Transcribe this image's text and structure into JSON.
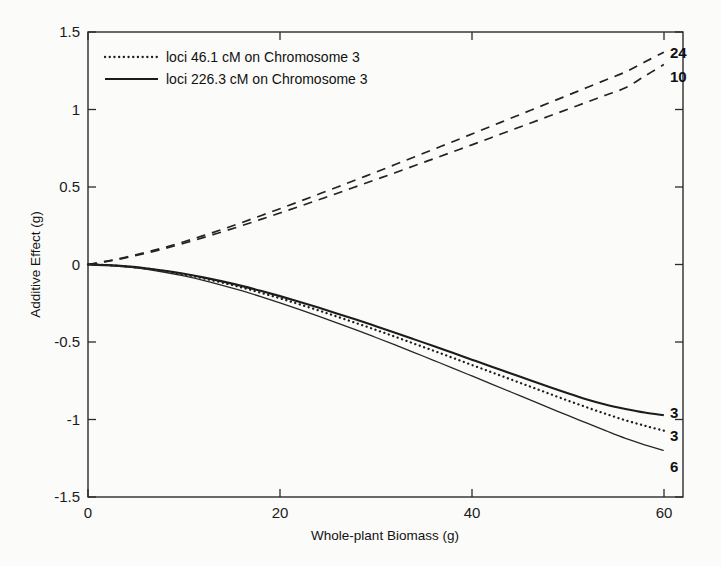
{
  "chart_data": {
    "type": "line",
    "title": "",
    "xlabel": "Whole-plant Biomass (g)",
    "ylabel": "Additive Effect (g)",
    "xlim": [
      0,
      62
    ],
    "ylim": [
      -1.5,
      1.5
    ],
    "xticks": [
      0,
      20,
      40,
      60
    ],
    "xtick_labels": [
      "0",
      "20",
      "40",
      "60"
    ],
    "yticks": [
      -1.5,
      -1,
      -0.5,
      0,
      0.5,
      1,
      1.5
    ],
    "ytick_labels": [
      "-1.5",
      "-1",
      "-0.5",
      "0",
      "0.5",
      "1",
      "1.5"
    ],
    "grid": false,
    "legend_position": "upper-left",
    "legend": [
      {
        "label": "loci 46.1 cM on Chromosome 3",
        "style": "dotted"
      },
      {
        "label": "loci 226.3 cM on Chromosome 3",
        "style": "solid"
      }
    ],
    "x": [
      0,
      2,
      4,
      6,
      8,
      10,
      12,
      14,
      16,
      18,
      20,
      22,
      24,
      26,
      28,
      30,
      32,
      34,
      36,
      38,
      40,
      42,
      44,
      46,
      48,
      50,
      52,
      54,
      56,
      58,
      60
    ],
    "series": [
      {
        "name": "24",
        "end_label": "24",
        "style": "dashed",
        "values": [
          0,
          0.022,
          0.048,
          0.078,
          0.111,
          0.147,
          0.186,
          0.227,
          0.27,
          0.315,
          0.36,
          0.406,
          0.453,
          0.5,
          0.548,
          0.596,
          0.645,
          0.694,
          0.743,
          0.792,
          0.842,
          0.892,
          0.942,
          0.992,
          1.042,
          1.092,
          1.142,
          1.192,
          1.242,
          1.306,
          1.37
        ]
      },
      {
        "name": "10",
        "end_label": "10",
        "style": "dashed",
        "values": [
          0,
          0.02,
          0.044,
          0.072,
          0.103,
          0.137,
          0.173,
          0.211,
          0.25,
          0.291,
          0.332,
          0.374,
          0.417,
          0.46,
          0.504,
          0.548,
          0.592,
          0.637,
          0.682,
          0.727,
          0.772,
          0.818,
          0.864,
          0.91,
          0.956,
          1.002,
          1.048,
          1.094,
          1.14,
          1.215,
          1.29
        ]
      },
      {
        "name": "3-solid",
        "end_label": "3",
        "style": "solid-thick",
        "values": [
          0,
          -0.004,
          -0.012,
          -0.024,
          -0.04,
          -0.06,
          -0.083,
          -0.109,
          -0.138,
          -0.17,
          -0.204,
          -0.24,
          -0.278,
          -0.317,
          -0.357,
          -0.398,
          -0.44,
          -0.483,
          -0.526,
          -0.57,
          -0.614,
          -0.658,
          -0.702,
          -0.745,
          -0.788,
          -0.83,
          -0.871,
          -0.905,
          -0.932,
          -0.955,
          -0.972
        ]
      },
      {
        "name": "3-dotted",
        "end_label": "3",
        "style": "dotted",
        "values": [
          0,
          -0.004,
          -0.013,
          -0.026,
          -0.043,
          -0.064,
          -0.089,
          -0.117,
          -0.148,
          -0.182,
          -0.218,
          -0.256,
          -0.296,
          -0.337,
          -0.379,
          -0.422,
          -0.466,
          -0.511,
          -0.556,
          -0.602,
          -0.648,
          -0.694,
          -0.74,
          -0.786,
          -0.832,
          -0.878,
          -0.922,
          -0.965,
          -1.005,
          -1.04,
          -1.072
        ]
      },
      {
        "name": "6-solid",
        "end_label": "6",
        "style": "solid-thin",
        "values": [
          0,
          -0.005,
          -0.015,
          -0.03,
          -0.05,
          -0.074,
          -0.102,
          -0.134,
          -0.169,
          -0.207,
          -0.247,
          -0.289,
          -0.333,
          -0.378,
          -0.424,
          -0.471,
          -0.519,
          -0.568,
          -0.618,
          -0.668,
          -0.719,
          -0.77,
          -0.821,
          -0.872,
          -0.923,
          -0.974,
          -1.024,
          -1.074,
          -1.122,
          -1.163,
          -1.2
        ]
      }
    ]
  },
  "axes": {
    "x_title": "Whole-plant Biomass (g)",
    "y_title": "Additive Effect (g)"
  },
  "legend": {
    "item_1_label": "loci 46.1 cM on Chromosome 3",
    "item_2_label": "loci 226.3 cM on Chromosome 3"
  },
  "end_labels": {
    "top_1": "24",
    "top_2": "10",
    "bottom_1": "3",
    "bottom_2": "3",
    "bottom_3": "6"
  },
  "xtick_labels": {
    "t0": "0",
    "t1": "20",
    "t2": "40",
    "t3": "60"
  },
  "ytick_labels": {
    "t0": "1.5",
    "t1": "1",
    "t2": "0.5",
    "t3": "0",
    "t4": "-0.5",
    "t5": "-1",
    "t6": "-1.5"
  }
}
